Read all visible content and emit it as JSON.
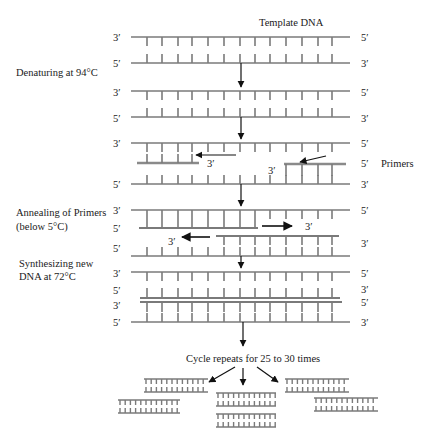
{
  "diagram": {
    "title": "Template DNA",
    "steps": [
      {
        "id": "denature",
        "label": "Denaturing at 94°C"
      },
      {
        "id": "anneal",
        "label_line1": "Annealing of Primers",
        "label_line2": "(below 5°C)"
      },
      {
        "id": "synth",
        "label_line1": "Synthesizing new",
        "label_line2": "DNA at 72°C"
      }
    ],
    "primers_label": "Primers",
    "cycle_label": "Cycle repeats for 25 to 30 times",
    "ends": {
      "three": "3′",
      "five": "5′"
    },
    "colors": {
      "strand": "#7a7a7a",
      "primer": "#9a9a9a",
      "text": "#1a1a1a",
      "arrow": "#111111"
    }
  }
}
